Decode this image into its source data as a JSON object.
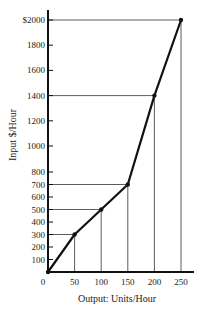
{
  "chart_data": {
    "type": "line",
    "title": "",
    "xlabel": "Output: Units/Hour",
    "ylabel": "Input $/Hour",
    "x": [
      0,
      50,
      100,
      150,
      200,
      250
    ],
    "series": [
      {
        "name": "Input cost",
        "values": [
          0,
          300,
          500,
          700,
          1400,
          2000
        ]
      }
    ],
    "xticks": [
      "0",
      "50",
      "100",
      "150",
      "200",
      "250"
    ],
    "yticks": [
      "100",
      "200",
      "300",
      "400",
      "500",
      "600",
      "700",
      "800",
      "1000",
      "1200",
      "1400",
      "1600",
      "1800",
      "$2000"
    ],
    "ytick_values": [
      100,
      200,
      300,
      400,
      500,
      600,
      700,
      800,
      1000,
      1200,
      1400,
      1600,
      1800,
      2000
    ],
    "xlim": [
      0,
      260
    ],
    "ylim": [
      0,
      2000
    ],
    "grid": false,
    "reference_lines": "Horizontal and vertical guide lines drawn from each data point to both axes",
    "legend": null,
    "colors": {
      "line": "#111111",
      "axis": "#111111",
      "guides": "#333333"
    }
  }
}
